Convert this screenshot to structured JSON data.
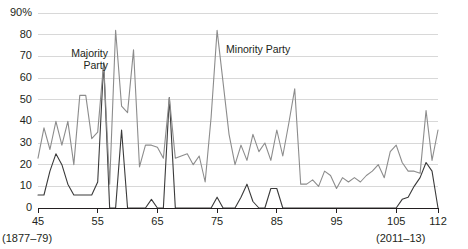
{
  "chart_data": {
    "type": "line",
    "title": "",
    "subtitle": "",
    "xlabel": "",
    "ylabel": "",
    "grid": true,
    "legend_position": "inline-annotation",
    "xlim": [
      45,
      112
    ],
    "ylim": [
      0,
      90
    ],
    "x_tick_labels": [
      "45",
      "55",
      "65",
      "75",
      "85",
      "95",
      "105",
      "112"
    ],
    "x_ticks": [
      45,
      55,
      65,
      75,
      85,
      95,
      105,
      112
    ],
    "y_tick_labels": [
      "0",
      "10",
      "20",
      "30",
      "40",
      "50",
      "60",
      "70",
      "80",
      "90%"
    ],
    "y_ticks": [
      0,
      10,
      20,
      30,
      40,
      50,
      60,
      70,
      80,
      90
    ],
    "range_start_label": "(1877–79)",
    "range_end_label": "(2011–13)",
    "x": [
      45,
      46,
      47,
      48,
      49,
      50,
      51,
      52,
      53,
      54,
      55,
      56,
      57,
      58,
      59,
      60,
      61,
      62,
      63,
      64,
      65,
      66,
      67,
      68,
      69,
      70,
      71,
      72,
      73,
      74,
      75,
      76,
      77,
      78,
      79,
      80,
      81,
      82,
      83,
      84,
      85,
      86,
      87,
      88,
      89,
      90,
      91,
      92,
      93,
      94,
      95,
      96,
      97,
      98,
      99,
      100,
      101,
      102,
      103,
      104,
      105,
      106,
      107,
      108,
      109,
      110,
      111,
      112
    ],
    "series": [
      {
        "name": "Majority Party",
        "color": "#3a3a3a",
        "values": [
          6,
          6,
          17,
          25,
          20,
          11,
          6,
          6,
          6,
          6,
          12,
          67,
          0,
          0,
          36,
          0,
          0,
          0,
          0,
          4,
          0,
          0,
          51,
          0,
          0,
          0,
          0,
          0,
          0,
          0,
          5,
          0,
          0,
          0,
          5,
          11,
          3,
          0,
          0,
          9,
          9,
          0,
          0,
          0,
          0,
          0,
          0,
          0,
          0,
          0,
          0,
          0,
          0,
          0,
          0,
          0,
          0,
          0,
          0,
          0,
          0,
          4,
          5,
          10,
          14,
          21,
          17,
          0
        ]
      },
      {
        "name": "Minority Party",
        "color": "#8c8c8c",
        "values": [
          23,
          37,
          27,
          40,
          29,
          40,
          20,
          52,
          52,
          32,
          35,
          67,
          11,
          82,
          47,
          44,
          73,
          19,
          29,
          29,
          28,
          23,
          51,
          23,
          24,
          25,
          20,
          24,
          12,
          42,
          82,
          58,
          34,
          20,
          29,
          22,
          34,
          26,
          30,
          22,
          36,
          24,
          39,
          55,
          11,
          11,
          13,
          10,
          17,
          15,
          9,
          14,
          12,
          14,
          12,
          15,
          17,
          20,
          14,
          26,
          29,
          21,
          17,
          17,
          16,
          45,
          22,
          36
        ]
      }
    ],
    "annotations": [
      {
        "id": "majority",
        "text_line1": "Majority",
        "text_line2": "Party"
      },
      {
        "id": "minority",
        "text_line1": "Minority Party",
        "text_line2": ""
      }
    ]
  },
  "axis_colors": {
    "grid": "#d8d8d8",
    "axis": "#231f20",
    "text": "#231f20"
  }
}
